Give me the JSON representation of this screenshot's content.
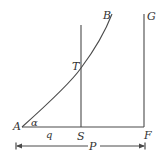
{
  "diagram": {
    "colors": {
      "stroke": "#4a4a4a",
      "text": "#333333"
    },
    "points": {
      "A": "A",
      "B": "B",
      "T": "T",
      "S": "S",
      "F": "F",
      "G": "G"
    },
    "angle_label": "α",
    "segment_AS_label": "q",
    "segment_AF_label": "P"
  }
}
